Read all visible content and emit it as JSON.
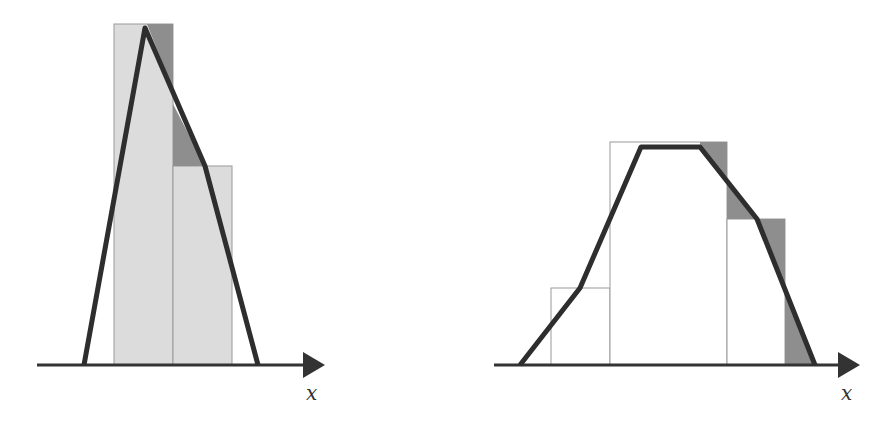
{
  "colors": {
    "light_bar": "#dcdcdc",
    "bar_outline": "#9a9a9a",
    "dark_fill": "#8e8e8e",
    "curve": "#2e2e2e",
    "axis": "#333333"
  },
  "left_diagram": {
    "axis_label": "x",
    "bars": [
      {
        "x0": 114,
        "x1": 173,
        "top": 24,
        "fill": "light"
      },
      {
        "x0": 173,
        "x1": 232,
        "top": 166,
        "fill": "light"
      }
    ],
    "curve_points": [
      [
        84,
        365
      ],
      [
        145,
        28
      ],
      [
        205,
        166
      ],
      [
        258,
        365
      ]
    ],
    "shaded_regions": [
      [
        [
          147,
          24
        ],
        [
          173,
          24
        ],
        [
          173,
          89
        ]
      ],
      [
        [
          173,
          104
        ],
        [
          173,
          166
        ],
        [
          205,
          166
        ]
      ]
    ]
  },
  "right_diagram": {
    "axis_label": "x",
    "bars": [
      {
        "x0": 551,
        "x1": 610,
        "top": 288,
        "fill": "none"
      },
      {
        "x0": 610,
        "x1": 727,
        "top": 142,
        "fill": "none"
      },
      {
        "x0": 727,
        "x1": 785,
        "top": 219,
        "fill": "none"
      }
    ],
    "curve_points": [
      [
        520,
        365
      ],
      [
        580,
        288
      ],
      [
        641,
        147
      ],
      [
        700,
        147
      ],
      [
        757,
        219
      ],
      [
        815,
        365
      ]
    ],
    "shaded_regions": [
      [
        [
          700,
          142
        ],
        [
          727,
          142
        ],
        [
          727,
          178
        ],
        [
          700,
          147
        ]
      ],
      [
        [
          727,
          184
        ],
        [
          727,
          219
        ],
        [
          757,
          219
        ]
      ],
      [
        [
          757,
          219
        ],
        [
          785,
          219
        ],
        [
          785,
          292
        ]
      ],
      [
        [
          785,
          292
        ],
        [
          785,
          365
        ],
        [
          815,
          365
        ]
      ]
    ]
  }
}
